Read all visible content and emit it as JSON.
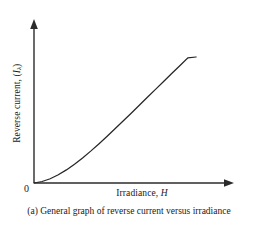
{
  "figure": {
    "caption": "(a) General graph of reverse current versus irradiance",
    "origin_label": "0",
    "background_color": "#ffffff",
    "ink_color": "#262626"
  },
  "chart_data": {
    "type": "line",
    "title": "",
    "subtitle": "",
    "xlabel": "Irradiance, H",
    "xlabel_text": "Irradiance,",
    "xlabel_symbol": "H",
    "ylabel": "Reverse current, (Iλ)",
    "ylabel_text": "Reverse current, (",
    "ylabel_symbol": "I",
    "ylabel_subscript": "λ",
    "ylabel_tail": ")",
    "grid": false,
    "legend": false,
    "legend_position": "none",
    "axis_arrows": true,
    "xlim": [
      0,
      1
    ],
    "ylim": [
      0,
      1
    ],
    "xticks": [],
    "yticks": [],
    "ticklabels_x": [],
    "ticklabels_y": [],
    "annotations": [],
    "series": [
      {
        "name": "reverse current vs irradiance",
        "color": "#262626",
        "x": [
          0.0,
          0.05,
          0.1,
          0.15,
          0.2,
          0.25,
          0.3,
          0.35,
          0.4,
          0.45,
          0.5,
          0.55,
          0.6,
          0.65,
          0.7,
          0.75,
          0.8,
          0.85,
          0.9,
          0.95,
          1.0
        ],
        "y": [
          0.0,
          0.012,
          0.034,
          0.065,
          0.104,
          0.149,
          0.199,
          0.253,
          0.31,
          0.369,
          0.43,
          0.492,
          0.554,
          0.617,
          0.68,
          0.743,
          0.806,
          0.869,
          0.931,
          0.993,
          1.0
        ]
      }
    ]
  }
}
